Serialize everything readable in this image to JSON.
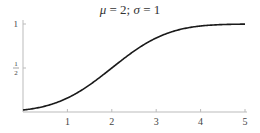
{
  "chart_data": {
    "type": "line",
    "title": "μ = 2; σ = 1",
    "title_parts": {
      "mu_sym": "μ",
      "mu_val": " = 2; ",
      "sigma_sym": "σ",
      "sigma_val": " = 1"
    },
    "xlabel": "",
    "ylabel": "",
    "xlim": [
      0,
      5
    ],
    "ylim": [
      0,
      1
    ],
    "x_ticks": [
      "1",
      "2",
      "3",
      "4",
      "5"
    ],
    "y_ticks": [
      "1/2",
      "1"
    ],
    "grid": false,
    "series": [
      {
        "name": "Normal CDF (μ=2, σ=1)",
        "x": [
          0,
          0.5,
          1,
          1.5,
          2,
          2.5,
          3,
          3.5,
          4,
          4.5,
          5
        ],
        "values": [
          0.023,
          0.067,
          0.159,
          0.309,
          0.5,
          0.691,
          0.841,
          0.933,
          0.977,
          0.994,
          0.999
        ]
      }
    ]
  }
}
